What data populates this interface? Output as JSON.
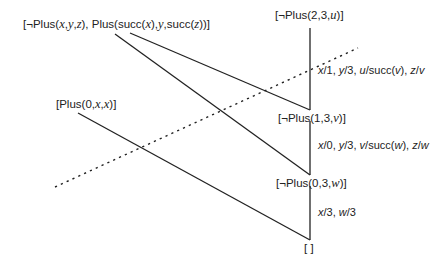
{
  "diagram": {
    "type": "resolution-refutation-tree",
    "nodes": {
      "clause_rule": "[¬Plus(x,y,z), Plus(succ(x),y,succ(z))]",
      "goal": "[¬Plus(2,3,u)]",
      "fact": "[Plus(0,x,x)]",
      "resolvent_1": "[¬Plus(1,3,v)]",
      "resolvent_2": "[¬Plus(0,3,w)]",
      "empty": "[ ]"
    },
    "substitutions": {
      "step_1": "x/1, y/3, u/succ(v), z/v",
      "step_2": "x/0, y/3, v/succ(w), z/w",
      "step_3": "x/3, w/3"
    },
    "edges": [
      {
        "from": "goal",
        "to": "resolvent_1"
      },
      {
        "from": "clause_rule",
        "to": "resolvent_1"
      },
      {
        "from": "resolvent_1",
        "to": "resolvent_2"
      },
      {
        "from": "clause_rule",
        "to": "resolvent_2"
      },
      {
        "from": "resolvent_2",
        "to": "empty"
      },
      {
        "from": "fact",
        "to": "empty"
      }
    ],
    "separator": {
      "style": "dotted"
    },
    "colors": {
      "line": "#222222",
      "background": "#ffffff"
    }
  }
}
